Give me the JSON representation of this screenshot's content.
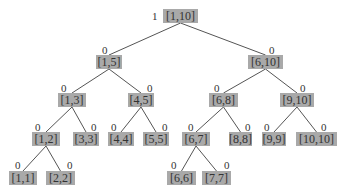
{
  "diagram": {
    "type": "segment-tree",
    "colors": {
      "node_fill": "#a9a9a9",
      "edge": "#555555",
      "text": "#333333"
    },
    "nodes": [
      {
        "id": "n1_10",
        "label": "[1,10]",
        "flag": "1",
        "x": 163,
        "y": 9,
        "w": 35,
        "fx": 152,
        "fy": 11
      },
      {
        "id": "n1_5",
        "label": "[1,5]",
        "flag": "0",
        "x": 96,
        "y": 55,
        "w": 26,
        "fx": 102,
        "fy": 45
      },
      {
        "id": "n6_10",
        "label": "[6,10]",
        "flag": "0",
        "x": 248,
        "y": 55,
        "w": 35,
        "fx": 269,
        "fy": 45
      },
      {
        "id": "n1_3",
        "label": "[1,3]",
        "flag": "0",
        "x": 58,
        "y": 93,
        "w": 28,
        "fx": 61,
        "fy": 83
      },
      {
        "id": "n4_5",
        "label": "[4,5]",
        "flag": "0",
        "x": 128,
        "y": 93,
        "w": 26,
        "fx": 147,
        "fy": 83
      },
      {
        "id": "n6_8",
        "label": "[6,8]",
        "flag": "0",
        "x": 209,
        "y": 93,
        "w": 29,
        "fx": 214,
        "fy": 83
      },
      {
        "id": "n9_10",
        "label": "[9,10]",
        "flag": "0",
        "x": 280,
        "y": 93,
        "w": 34,
        "fx": 300,
        "fy": 83
      },
      {
        "id": "n1_2",
        "label": "[1,2]",
        "flag": "0",
        "x": 32,
        "y": 132,
        "w": 28,
        "fx": 35,
        "fy": 122
      },
      {
        "id": "n3_3",
        "label": "[3,3]",
        "flag": "0",
        "x": 73,
        "y": 132,
        "w": 26,
        "fx": 91,
        "fy": 122
      },
      {
        "id": "n4_4",
        "label": "[4,4]",
        "flag": "0",
        "x": 108,
        "y": 132,
        "w": 26,
        "fx": 111,
        "fy": 122
      },
      {
        "id": "n5_5",
        "label": "[5,5]",
        "flag": "0",
        "x": 143,
        "y": 132,
        "w": 26,
        "fx": 162,
        "fy": 122
      },
      {
        "id": "n6_7",
        "label": "[6,7]",
        "flag": "0",
        "x": 182,
        "y": 132,
        "w": 28,
        "fx": 188,
        "fy": 122
      },
      {
        "id": "n8_8",
        "label": "[8,8]",
        "flag": "0",
        "x": 229,
        "y": 132,
        "w": 23,
        "fx": 245,
        "fy": 122
      },
      {
        "id": "n9_9",
        "label": "[9,9]",
        "flag": "0",
        "x": 262,
        "y": 132,
        "w": 24,
        "fx": 264,
        "fy": 122
      },
      {
        "id": "n10_10",
        "label": "[10,10]",
        "flag": "0",
        "x": 296,
        "y": 132,
        "w": 41,
        "fx": 321,
        "fy": 122
      },
      {
        "id": "n1_1",
        "label": "[1,1]",
        "flag": "0",
        "x": 9,
        "y": 171,
        "w": 28,
        "fx": 15,
        "fy": 160
      },
      {
        "id": "n2_2",
        "label": "[2,2]",
        "flag": "0",
        "x": 46,
        "y": 171,
        "w": 29,
        "fx": 67,
        "fy": 160
      },
      {
        "id": "n6_6",
        "label": "[6,6]",
        "flag": "0",
        "x": 167,
        "y": 171,
        "w": 29,
        "fx": 171,
        "fy": 160
      },
      {
        "id": "n7_7",
        "label": "[7,7]",
        "flag": "0",
        "x": 202,
        "y": 171,
        "w": 29,
        "fx": 224,
        "fy": 160
      }
    ],
    "edges": [
      [
        "n1_10",
        "n1_5"
      ],
      [
        "n1_10",
        "n6_10"
      ],
      [
        "n1_5",
        "n1_3"
      ],
      [
        "n1_5",
        "n4_5"
      ],
      [
        "n6_10",
        "n6_8"
      ],
      [
        "n6_10",
        "n9_10"
      ],
      [
        "n1_3",
        "n1_2"
      ],
      [
        "n1_3",
        "n3_3"
      ],
      [
        "n4_5",
        "n4_4"
      ],
      [
        "n4_5",
        "n5_5"
      ],
      [
        "n6_8",
        "n6_7"
      ],
      [
        "n6_8",
        "n8_8"
      ],
      [
        "n9_10",
        "n9_9"
      ],
      [
        "n9_10",
        "n10_10"
      ],
      [
        "n1_2",
        "n1_1"
      ],
      [
        "n1_2",
        "n2_2"
      ],
      [
        "n6_7",
        "n6_6"
      ],
      [
        "n6_7",
        "n7_7"
      ]
    ]
  }
}
